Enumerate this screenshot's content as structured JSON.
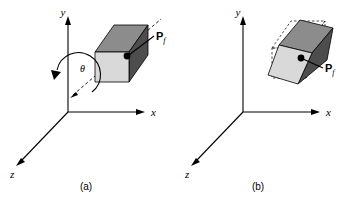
{
  "figure": {
    "background_color": "#ffffff",
    "line_color": "#000000",
    "panels": [
      {
        "id": "a",
        "caption": "(a)",
        "axes": {
          "x_label": "x",
          "y_label": "y",
          "z_label": "z"
        },
        "angle_label": "θ",
        "point_label": "P",
        "point_subscript": "f",
        "cube": {
          "front_face_color": "#d9d9d9",
          "top_face_color": "#8c8c8c",
          "right_face_color": "#4d4d4d",
          "edge_color": "#000000"
        }
      },
      {
        "id": "b",
        "caption": "(b)",
        "axes": {
          "x_label": "x",
          "y_label": "y",
          "z_label": "z"
        },
        "point_label": "P",
        "point_subscript": "f",
        "cube": {
          "front_face_color": "#d9d9d9",
          "top_face_color": "#8c8c8c",
          "right_face_color": "#4d4d4d",
          "edge_color": "#000000",
          "ghost_outline_style": "dashed"
        }
      }
    ]
  }
}
